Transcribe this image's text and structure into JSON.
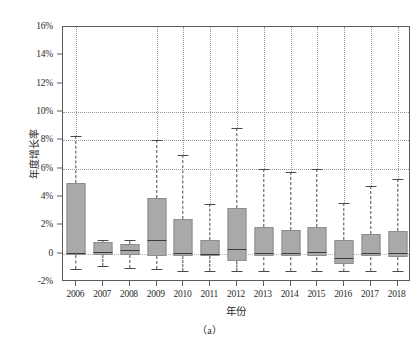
{
  "chart_data": {
    "type": "box",
    "title": "",
    "subtitle": "",
    "caption": "（a）",
    "xlabel": "年份",
    "ylabel": "年度增长率",
    "categories": [
      "2006",
      "2007",
      "2008",
      "2009",
      "2010",
      "2011",
      "2012",
      "2013",
      "2014",
      "2015",
      "2016",
      "2017",
      "2018"
    ],
    "ylim": [
      -2,
      16
    ],
    "ytick_values": [
      -2,
      0,
      2,
      4,
      6,
      8,
      10,
      12,
      14,
      16
    ],
    "ytick_labels": [
      "-2%",
      "0",
      "2%",
      "4%",
      "6%",
      "8%",
      "10%",
      "12%",
      "14%",
      "16%"
    ],
    "gridlines_y": [
      0,
      6,
      8,
      10
    ],
    "grid": true,
    "legend": "none",
    "unit": "%",
    "boxes": [
      {
        "year": "2006",
        "whisker_low": -1.1,
        "q1": -0.1,
        "median": 0.05,
        "q3": 5.0,
        "whisker_high": 8.3
      },
      {
        "year": "2007",
        "whisker_low": -0.9,
        "q1": -0.1,
        "median": 0.15,
        "q3": 0.85,
        "whisker_high": 0.95
      },
      {
        "year": "2008",
        "whisker_low": -1.0,
        "q1": -0.1,
        "median": 0.25,
        "q3": 0.7,
        "whisker_high": 1.0
      },
      {
        "year": "2009",
        "whisker_low": -1.1,
        "q1": -0.15,
        "median": 0.95,
        "q3": 3.9,
        "whisker_high": 8.0
      },
      {
        "year": "2010",
        "whisker_low": -1.2,
        "q1": -0.15,
        "median": 0.05,
        "q3": 2.45,
        "whisker_high": 7.0
      },
      {
        "year": "2011",
        "whisker_low": -1.2,
        "q1": -0.15,
        "median": 0.0,
        "q3": 0.95,
        "whisker_high": 3.5
      },
      {
        "year": "2012",
        "whisker_low": -1.2,
        "q1": -0.5,
        "median": 0.3,
        "q3": 3.25,
        "whisker_high": 8.9
      },
      {
        "year": "2013",
        "whisker_low": -1.2,
        "q1": -0.2,
        "median": 0.05,
        "q3": 1.85,
        "whisker_high": 6.0
      },
      {
        "year": "2014",
        "whisker_low": -1.2,
        "q1": -0.2,
        "median": 0.05,
        "q3": 1.7,
        "whisker_high": 5.8
      },
      {
        "year": "2015",
        "whisker_low": -1.2,
        "q1": -0.2,
        "median": 0.1,
        "q3": 1.85,
        "whisker_high": 6.0
      },
      {
        "year": "2016",
        "whisker_low": -1.2,
        "q1": -0.7,
        "median": -0.3,
        "q3": 0.95,
        "whisker_high": 3.6
      },
      {
        "year": "2017",
        "whisker_low": -1.2,
        "q1": -0.2,
        "median": 0.05,
        "q3": 1.4,
        "whisker_high": 4.8
      },
      {
        "year": "2018",
        "whisker_low": -1.2,
        "q1": -0.2,
        "median": 0.05,
        "q3": 1.6,
        "whisker_high": 5.3
      }
    ],
    "colors": {
      "box_fill": "#a9a9a9",
      "box_edge": "#8e8e8e",
      "median": "#3c3c3c",
      "whisker": "#4a4a4a",
      "grid": "#9a9a9a",
      "axis": "#5b5b5b",
      "background": "#ffffff"
    }
  }
}
